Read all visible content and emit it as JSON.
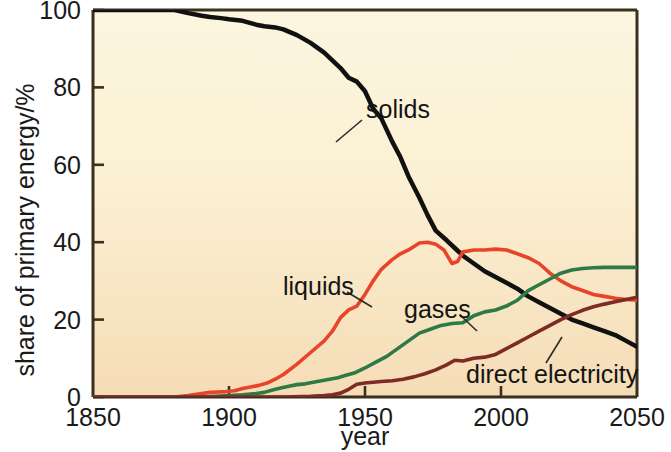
{
  "figure": {
    "background": "#ffffff",
    "plot_background_top": "#fbf4dc",
    "plot_background_bottom": "#f6debc",
    "axis_color": "#3b2f1e"
  },
  "axes": {
    "y_title": "share of primary energy/%",
    "x_title": "year",
    "y_ticks": [
      "0",
      "20",
      "40",
      "60",
      "80",
      "100"
    ],
    "x_ticks": [
      "1850",
      "1900",
      "1950",
      "2000",
      "2050"
    ]
  },
  "labels": {
    "solids": "solids",
    "liquids": "liquids",
    "gases": "gases",
    "direct_electricity": "direct electricity"
  },
  "colors": {
    "solids": "#111111",
    "liquids": "#e8442a",
    "gases": "#2d7a45",
    "direct_electricity": "#7e2b26"
  },
  "chart_data": {
    "type": "line",
    "title": "",
    "subtitle": "",
    "xlabel": "year",
    "ylabel": "share of primary energy/%",
    "xlim": [
      1850,
      2050
    ],
    "ylim": [
      0,
      100
    ],
    "xticks": [
      1850,
      1900,
      1950,
      2000,
      2050
    ],
    "yticks": [
      0,
      20,
      40,
      60,
      80,
      100
    ],
    "grid": false,
    "legend": "inline-annotations",
    "annotations": [
      {
        "text": "solids",
        "x": 1985,
        "y": 86,
        "points_to": {
          "x": 1950,
          "y": 78
        }
      },
      {
        "text": "liquids",
        "x": 1923,
        "y": 29,
        "points_to": {
          "x": 1944,
          "y": 22
        }
      },
      {
        "text": "gases",
        "x": 1968,
        "y": 24,
        "points_to": {
          "x": 1983,
          "y": 17
        }
      },
      {
        "text": "direct electricity",
        "x": 1992,
        "y": 8,
        "points_to": {
          "x": 2020,
          "y": 14
        }
      }
    ],
    "series": [
      {
        "name": "solids",
        "color": "#111111",
        "x": [
          1850,
          1860,
          1870,
          1880,
          1885,
          1890,
          1893,
          1897,
          1900,
          1905,
          1910,
          1913,
          1917,
          1920,
          1925,
          1930,
          1935,
          1938,
          1941,
          1944,
          1947,
          1950,
          1953,
          1956,
          1960,
          1963,
          1966,
          1970,
          1973,
          1976,
          1980,
          1983,
          1986,
          1990,
          1994,
          1998,
          2002,
          2006,
          2010,
          2014,
          2018,
          2022,
          2026,
          2030,
          2034,
          2038,
          2042,
          2046,
          2050
        ],
        "y": [
          100,
          100,
          100,
          100,
          99.2,
          98.5,
          98.2,
          97.9,
          97.6,
          97.2,
          96.2,
          95.8,
          95.5,
          95.0,
          93.5,
          91.5,
          89.0,
          87.0,
          85.0,
          82.5,
          81.5,
          79.0,
          74.5,
          72.0,
          66.0,
          62.0,
          57.0,
          51.5,
          47.0,
          43.0,
          40.5,
          38.5,
          36.5,
          34.5,
          32.5,
          31.0,
          29.5,
          28.0,
          26.0,
          24.5,
          23.0,
          21.5,
          20.0,
          19.0,
          18.0,
          17.0,
          16.0,
          14.5,
          13.0
        ]
      },
      {
        "name": "liquids",
        "color": "#e8442a",
        "x": [
          1850,
          1870,
          1880,
          1885,
          1890,
          1893,
          1896,
          1899,
          1902,
          1905,
          1908,
          1911,
          1914,
          1917,
          1920,
          1925,
          1930,
          1935,
          1938,
          1941,
          1944,
          1947,
          1950,
          1953,
          1956,
          1960,
          1963,
          1966,
          1970,
          1973,
          1976,
          1979,
          1982,
          1984,
          1986,
          1990,
          1994,
          1998,
          2002,
          2006,
          2010,
          2014,
          2018,
          2022,
          2026,
          2030,
          2034,
          2038,
          2042,
          2046,
          2050
        ],
        "y": [
          0,
          0,
          0,
          0.4,
          0.9,
          1.2,
          1.3,
          1.4,
          1.6,
          2.2,
          2.6,
          3.0,
          3.6,
          4.6,
          5.8,
          8.5,
          11.5,
          14.5,
          17.0,
          20.5,
          22.5,
          23.5,
          26.5,
          30.0,
          33.0,
          35.5,
          37.0,
          38.0,
          39.8,
          40.0,
          39.5,
          38.0,
          34.5,
          35.0,
          37.5,
          38.0,
          38.0,
          38.2,
          38.0,
          37.0,
          36.0,
          34.5,
          32.0,
          30.0,
          28.5,
          27.5,
          26.5,
          26.0,
          25.5,
          25.2,
          25.0
        ]
      },
      {
        "name": "gases",
        "color": "#2d7a45",
        "x": [
          1850,
          1880,
          1890,
          1895,
          1900,
          1905,
          1910,
          1913,
          1916,
          1919,
          1922,
          1925,
          1928,
          1931,
          1934,
          1937,
          1940,
          1943,
          1946,
          1950,
          1954,
          1958,
          1962,
          1966,
          1970,
          1974,
          1978,
          1982,
          1986,
          1990,
          1994,
          1998,
          2002,
          2006,
          2010,
          2014,
          2018,
          2022,
          2026,
          2030,
          2034,
          2038,
          2042,
          2046,
          2050
        ],
        "y": [
          0,
          0,
          0,
          0.2,
          0.4,
          0.6,
          0.9,
          1.2,
          1.8,
          2.3,
          2.8,
          3.2,
          3.4,
          3.8,
          4.2,
          4.6,
          5.0,
          5.6,
          6.2,
          7.5,
          9.0,
          10.5,
          12.5,
          14.5,
          16.5,
          17.5,
          18.5,
          19.0,
          19.2,
          21.0,
          22.0,
          22.5,
          23.5,
          25.0,
          27.5,
          29.0,
          30.5,
          32.0,
          32.8,
          33.2,
          33.4,
          33.5,
          33.5,
          33.5,
          33.5
        ]
      },
      {
        "name": "direct electricity",
        "color": "#7e2b26",
        "x": [
          1850,
          1900,
          1920,
          1930,
          1935,
          1938,
          1941,
          1944,
          1947,
          1950,
          1953,
          1956,
          1960,
          1964,
          1968,
          1972,
          1976,
          1980,
          1983,
          1986,
          1990,
          1994,
          1998,
          2002,
          2006,
          2010,
          2014,
          2018,
          2022,
          2026,
          2030,
          2034,
          2038,
          2042,
          2046,
          2050
        ],
        "y": [
          0,
          0,
          0,
          0.2,
          0.4,
          0.6,
          1.0,
          2.0,
          3.3,
          3.6,
          3.8,
          4.0,
          4.2,
          4.6,
          5.2,
          6.0,
          7.0,
          8.3,
          9.5,
          9.3,
          10.0,
          10.3,
          11.0,
          12.5,
          14.0,
          15.5,
          17.0,
          18.5,
          20.0,
          21.3,
          22.4,
          23.3,
          24.0,
          24.6,
          25.2,
          25.8
        ]
      }
    ]
  }
}
